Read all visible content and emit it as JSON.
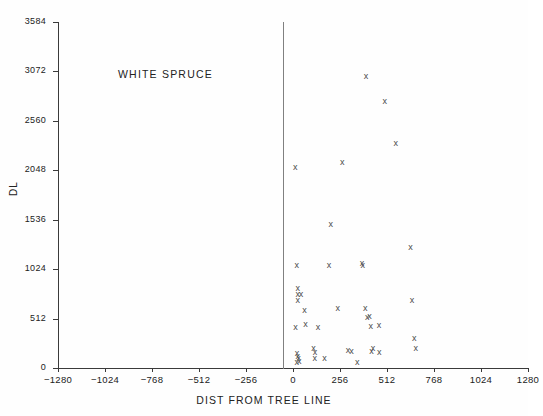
{
  "chart_data": {
    "type": "scatter",
    "title": "",
    "annotation": "WHITE SPRUCE",
    "xlabel": "DIST FROM TREE LINE",
    "ylabel": "DL",
    "xlim": [
      -1280,
      1280
    ],
    "ylim": [
      0,
      3584
    ],
    "xticks": [
      -1280,
      -1024,
      -768,
      -512,
      -256,
      0,
      256,
      512,
      768,
      1024,
      1280
    ],
    "xtick_labels": [
      "-1280",
      "-1024",
      "-768",
      "-512",
      "-256",
      "0",
      "256",
      "512",
      "768",
      "1024",
      "1280"
    ],
    "yticks": [
      0,
      512,
      1024,
      1536,
      2048,
      2560,
      3072,
      3584
    ],
    "ytick_labels": [
      "0",
      "512",
      "1024",
      "1536",
      "2048",
      "2560",
      "3072",
      "3584"
    ],
    "grid": false,
    "legend": null,
    "marker": "x",
    "marker_color": "#4a4a4a",
    "reference_line_x": 0,
    "series": [
      {
        "name": "white spruce",
        "points": [
          [
            12,
            2080
          ],
          [
            20,
            1060
          ],
          [
            26,
            820
          ],
          [
            26,
            760
          ],
          [
            44,
            760
          ],
          [
            26,
            700
          ],
          [
            14,
            420
          ],
          [
            22,
            150
          ],
          [
            26,
            120
          ],
          [
            30,
            96
          ],
          [
            34,
            70
          ],
          [
            20,
            60
          ],
          [
            62,
            600
          ],
          [
            68,
            450
          ],
          [
            112,
            200
          ],
          [
            120,
            160
          ],
          [
            118,
            96
          ],
          [
            136,
            420
          ],
          [
            172,
            96
          ],
          [
            196,
            1060
          ],
          [
            205,
            1490
          ],
          [
            244,
            620
          ],
          [
            268,
            2130
          ],
          [
            300,
            180
          ],
          [
            318,
            170
          ],
          [
            376,
            1080
          ],
          [
            380,
            1060
          ],
          [
            393,
            620
          ],
          [
            398,
            3020
          ],
          [
            404,
            520
          ],
          [
            416,
            530
          ],
          [
            424,
            430
          ],
          [
            428,
            170
          ],
          [
            436,
            200
          ],
          [
            468,
            440
          ],
          [
            470,
            160
          ],
          [
            500,
            2760
          ],
          [
            560,
            2330
          ],
          [
            640,
            1250
          ],
          [
            648,
            700
          ],
          [
            660,
            310
          ],
          [
            668,
            200
          ],
          [
            350,
            60
          ]
        ]
      }
    ]
  }
}
